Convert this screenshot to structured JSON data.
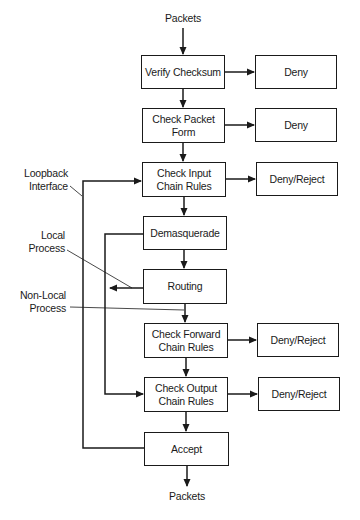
{
  "diagram": {
    "input_label": "Packets",
    "output_label": "Packets",
    "nodes": {
      "verify_checksum": "Verify Checksum",
      "check_packet_form": "Check Packet\nForm",
      "check_input_chain": "Check Input\nChain Rules",
      "demasquerade": "Demasquerade",
      "routing": "Routing",
      "check_forward_chain": "Check Forward\nChain Rules",
      "check_output_chain": "Check Output\nChain Rules",
      "accept": "Accept"
    },
    "outcomes": {
      "checksum_fail": "Deny",
      "form_fail": "Deny",
      "input_fail": "Deny/Reject",
      "forward_fail": "Deny/Reject",
      "output_fail": "Deny/Reject"
    },
    "annotations": {
      "loopback": "Loopback\nInterface",
      "local_process": "Local\nProcess",
      "non_local_process": "Non-Local\nProcess"
    },
    "colors": {
      "stroke": "#1a1a1a",
      "background": "#ffffff"
    }
  }
}
